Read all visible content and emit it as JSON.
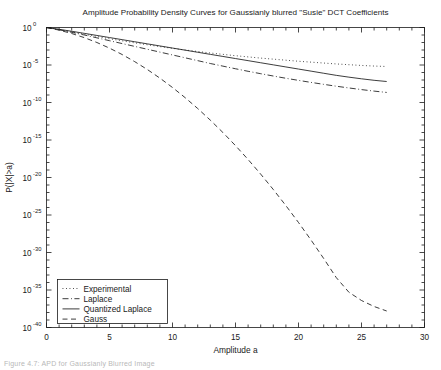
{
  "figure": {
    "caption": "Figure 4.7: APD for Gaussianly Blurred Image"
  },
  "chart_data": {
    "type": "line",
    "title": "Amplitude Probability Density Curves for Gaussianly blurred \"Susie\" DCT Coefficients",
    "xlabel": "Amplitude a",
    "ylabel": "P(|X|>a)",
    "xlim": [
      0,
      30
    ],
    "ylim_log10": [
      -40,
      0
    ],
    "xticks": [
      0,
      5,
      10,
      15,
      20,
      25,
      30
    ],
    "xticklabels": [
      "0",
      "5",
      "10",
      "15",
      "20",
      "25",
      "30"
    ],
    "yticks_log10": [
      0,
      -5,
      -10,
      -15,
      -20,
      -25,
      -30,
      -35,
      -40
    ],
    "yticklabels": [
      "10^0",
      "10^-5",
      "10^-10",
      "10^-15",
      "10^-20",
      "10^-25",
      "10^-30",
      "10^-35",
      "10^-40"
    ],
    "ytick_mantissa": "10",
    "ytick_exponents": [
      "0",
      "-5",
      "-10",
      "-15",
      "-20",
      "-25",
      "-30",
      "-35",
      "-40"
    ],
    "grid": false,
    "legend_position": "lower left",
    "series": [
      {
        "name": "Experimental",
        "style": "dotted",
        "color": "#1a1a1a",
        "x": [
          0,
          1,
          2,
          3,
          4,
          5,
          6,
          7,
          8,
          9,
          10,
          11,
          12,
          13,
          14,
          15,
          16,
          17,
          18,
          19,
          20,
          21,
          22,
          23,
          24,
          25,
          26,
          27
        ],
        "y_log10": [
          0,
          -0.28,
          -0.58,
          -0.9,
          -1.2,
          -1.5,
          -1.78,
          -2.05,
          -2.3,
          -2.55,
          -2.78,
          -3.0,
          -3.2,
          -3.4,
          -3.58,
          -3.76,
          -3.92,
          -4.08,
          -4.22,
          -4.36,
          -4.5,
          -4.62,
          -4.74,
          -4.86,
          -4.96,
          -5.06,
          -5.14,
          -5.2
        ]
      },
      {
        "name": "Laplace",
        "style": "dashdot",
        "color": "#1a1a1a",
        "x": [
          0,
          1,
          2,
          3,
          4,
          5,
          6,
          7,
          8,
          9,
          10,
          11,
          12,
          13,
          14,
          15,
          16,
          17,
          18,
          19,
          20,
          21,
          22,
          23,
          24,
          25,
          26,
          27
        ],
        "y_log10": [
          0,
          -0.3,
          -0.64,
          -1.0,
          -1.38,
          -1.76,
          -2.14,
          -2.52,
          -2.9,
          -3.28,
          -3.66,
          -4.04,
          -4.42,
          -4.8,
          -5.15,
          -5.5,
          -5.84,
          -6.16,
          -6.47,
          -6.77,
          -7.05,
          -7.32,
          -7.58,
          -7.83,
          -8.06,
          -8.28,
          -8.48,
          -8.66
        ]
      },
      {
        "name": "Quantized Laplace",
        "style": "solid",
        "color": "#1a1a1a",
        "x": [
          0,
          1,
          2,
          3,
          4,
          5,
          6,
          7,
          8,
          9,
          10,
          11,
          12,
          13,
          14,
          15,
          16,
          17,
          18,
          19,
          20,
          21,
          22,
          23,
          24,
          25,
          26,
          27
        ],
        "y_log10": [
          0,
          -0.24,
          -0.5,
          -0.78,
          -1.06,
          -1.34,
          -1.62,
          -1.9,
          -2.18,
          -2.46,
          -2.74,
          -3.02,
          -3.3,
          -3.58,
          -3.86,
          -4.14,
          -4.42,
          -4.7,
          -4.98,
          -5.26,
          -5.54,
          -5.82,
          -6.1,
          -6.38,
          -6.62,
          -6.84,
          -7.04,
          -7.2
        ]
      },
      {
        "name": "Gauss",
        "style": "dashed",
        "color": "#1a1a1a",
        "x": [
          0,
          1,
          2,
          3,
          4,
          5,
          6,
          7,
          8,
          9,
          10,
          11,
          12,
          13,
          14,
          15,
          16,
          17,
          18,
          19,
          20,
          21,
          22,
          23,
          24,
          25,
          26,
          27
        ],
        "y_log10": [
          0,
          -0.35,
          -0.8,
          -1.35,
          -2.0,
          -2.75,
          -3.6,
          -4.55,
          -5.6,
          -6.75,
          -8.0,
          -9.35,
          -10.8,
          -12.35,
          -14.0,
          -15.75,
          -17.6,
          -19.55,
          -21.6,
          -23.75,
          -26.0,
          -28.35,
          -30.8,
          -33.35,
          -35.3,
          -36.4,
          -37.2,
          -37.8
        ]
      }
    ]
  }
}
